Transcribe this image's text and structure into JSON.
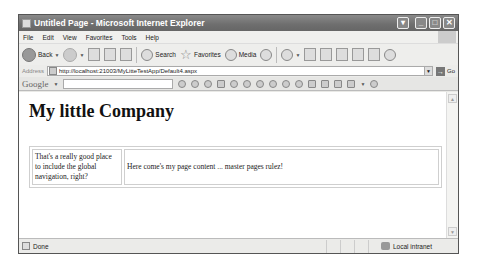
{
  "window": {
    "title": "Untitled Page - Microsoft Internet Explorer",
    "controls": [
      "menu",
      "minimize",
      "maximize",
      "close"
    ]
  },
  "menubar": {
    "items": [
      "File",
      "Edit",
      "View",
      "Favorites",
      "Tools",
      "Help"
    ]
  },
  "toolbar": {
    "back_label": "Back",
    "search_label": "Search",
    "favorites_label": "Favorites",
    "media_label": "Media"
  },
  "addressbar": {
    "label": "Address",
    "url": "http://localhost:21003/MyLitteTestApp/Default4.aspx",
    "go_label": "Go"
  },
  "googlebar": {
    "brand": "Google",
    "search_value": ""
  },
  "page": {
    "heading": "My little Company",
    "nav_text": "That's a really good place to include the global navigation, right?",
    "content_text": "Here come's my page content ... master pages rulez!"
  },
  "statusbar": {
    "status": "Done",
    "zone": "Local intranet"
  }
}
